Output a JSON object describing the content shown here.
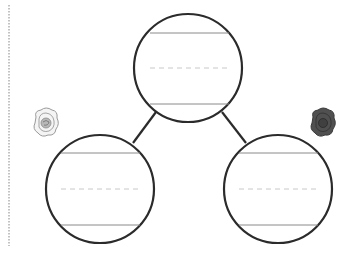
{
  "diagram": {
    "type": "tree-map-graphic-organizer",
    "colors": {
      "stroke": "#2b2b2b",
      "rule": "#8a8a8a",
      "dash": "#c8c8c8",
      "margin": "#b0b0b0",
      "rose_light": "#9a9a9a",
      "rose_dark": "#4a4a4a"
    },
    "nodes": [
      {
        "id": "top",
        "label": "",
        "cx": 188,
        "cy": 68,
        "r": 54
      },
      {
        "id": "bottom-left",
        "label": "",
        "cx": 100,
        "cy": 189,
        "r": 54
      },
      {
        "id": "bottom-right",
        "label": "",
        "cx": 278,
        "cy": 189,
        "r": 54
      }
    ],
    "edges": [
      {
        "from": "top",
        "to": "bottom-left"
      },
      {
        "from": "top",
        "to": "bottom-right"
      }
    ],
    "decorations": [
      {
        "name": "rose-outline-icon",
        "x": 46,
        "y": 123
      },
      {
        "name": "rose-filled-icon",
        "x": 323,
        "y": 123
      }
    ]
  }
}
